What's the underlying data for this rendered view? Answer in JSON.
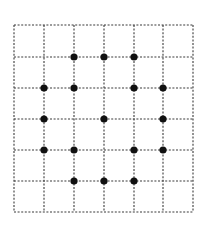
{
  "diagram": {
    "type": "dot-grid",
    "grid": {
      "columns": 6,
      "rows": 6,
      "x_lines": [
        14,
        44,
        74,
        104,
        134,
        163,
        193
      ],
      "y_lines": [
        25,
        57,
        88,
        119,
        150,
        181,
        212
      ],
      "line_color": "#3a3a3a",
      "line_style": "dashed"
    },
    "dot_color": "#111111",
    "dot_radius": 3.6,
    "dots": [
      {
        "col": 2,
        "row": 1
      },
      {
        "col": 3,
        "row": 1
      },
      {
        "col": 4,
        "row": 1
      },
      {
        "col": 1,
        "row": 2
      },
      {
        "col": 2,
        "row": 2
      },
      {
        "col": 4,
        "row": 2
      },
      {
        "col": 5,
        "row": 2
      },
      {
        "col": 1,
        "row": 3
      },
      {
        "col": 3,
        "row": 3
      },
      {
        "col": 5,
        "row": 3
      },
      {
        "col": 1,
        "row": 4
      },
      {
        "col": 2,
        "row": 4
      },
      {
        "col": 4,
        "row": 4
      },
      {
        "col": 5,
        "row": 4
      },
      {
        "col": 2,
        "row": 5
      },
      {
        "col": 3,
        "row": 5
      },
      {
        "col": 4,
        "row": 5
      }
    ]
  }
}
